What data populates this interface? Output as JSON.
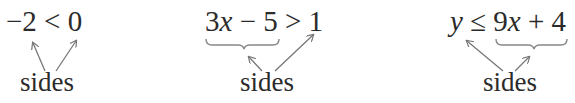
{
  "panels": [
    {
      "expression": {
        "left": "−2",
        "operator": "<",
        "right": "0"
      },
      "label": "sides",
      "brace_under": null
    },
    {
      "expression": {
        "left_coef": "3",
        "left_var": "x",
        "left_rest": " − 5",
        "operator": ">",
        "right": "1"
      },
      "label": "sides",
      "brace_under": "left"
    },
    {
      "expression": {
        "left_var": "y",
        "operator": "≤",
        "right_coef": "9",
        "right_var": "x",
        "right_rest": " + 4"
      },
      "label": "sides",
      "brace_under": "right"
    }
  ],
  "colors": {
    "text": "#2b2b2b",
    "arrow": "#777777",
    "brace": "#888888"
  }
}
